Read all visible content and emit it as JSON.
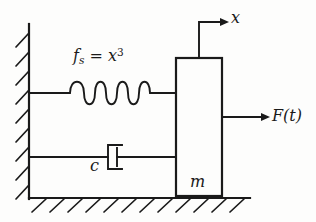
{
  "figure": {
    "type": "mechanical-schematic",
    "background_color": "#fdfdfc",
    "line_color": "#1a1a1a"
  },
  "labels": {
    "spring": {
      "name": "nonlinear-spring-force",
      "base": "f",
      "subscript": "s",
      "relation": " = ",
      "variable": "x",
      "exponent": "3",
      "full_text": "f_s = x^3"
    },
    "damper": {
      "name": "damping-coefficient",
      "symbol": "c",
      "full_text": "c"
    },
    "mass": {
      "name": "mass-symbol",
      "symbol": "m",
      "full_text": "m"
    },
    "force": {
      "name": "external-force",
      "symbol": "F",
      "argument": "(t)",
      "full_text": "F(t)"
    },
    "displacement": {
      "name": "displacement-coordinate",
      "symbol": "x",
      "full_text": "x"
    }
  },
  "components": {
    "wall": {
      "name": "fixed-wall",
      "orientation": "vertical-left",
      "hatch_count": 9,
      "x": 29,
      "y_top": 24,
      "y_bottom": 198
    },
    "ground": {
      "name": "fixed-ground",
      "orientation": "horizontal-bottom",
      "hatch_count": 12,
      "y": 198,
      "x_left": 29,
      "x_right": 250
    },
    "spring": {
      "name": "coil-spring",
      "coils": 4,
      "y": 93,
      "x_start": 29,
      "x_end": 176
    },
    "damper": {
      "name": "dashpot-damper",
      "y": 157,
      "x_start": 29,
      "x_end": 176
    },
    "mass_block": {
      "name": "mass-block",
      "x": 176,
      "y": 58,
      "width": 46,
      "height": 138
    },
    "force_arrow": {
      "name": "force-arrow",
      "direction": "right",
      "y": 117,
      "x_start": 222,
      "x_end": 268
    },
    "displacement_arrow": {
      "name": "displacement-arrow",
      "direction": "right",
      "corner_x": 199,
      "y_top": 22,
      "y_bottom": 58,
      "x_end": 227
    }
  }
}
